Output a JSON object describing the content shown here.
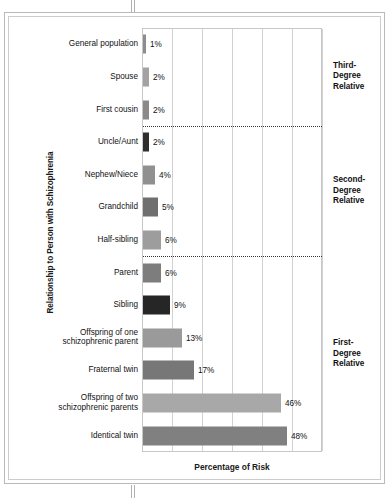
{
  "chart_data": {
    "type": "bar",
    "orientation": "horizontal",
    "title": "",
    "xlabel": "Percentage of Risk",
    "ylabel": "Relationship to Person with Schizophrenia",
    "xlim": [
      0,
      60
    ],
    "grid": true,
    "gridlines_x": [
      0,
      10,
      20,
      30,
      40,
      50,
      60
    ],
    "legend": "none",
    "categories": [
      "General population",
      "Spouse",
      "First cousin",
      "Uncle/Aunt",
      "Nephew/Niece",
      "Grandchild",
      "Half-sibling",
      "Parent",
      "Sibling",
      "Offspring of one schizophrenic parent",
      "Fraternal twin",
      "Offspring of two schizophrenic parents",
      "Identical twin"
    ],
    "values": [
      1,
      2,
      2,
      2,
      4,
      5,
      6,
      6,
      9,
      13,
      17,
      46,
      48
    ],
    "value_labels": [
      "1%",
      "2%",
      "2%",
      "2%",
      "4%",
      "5%",
      "6%",
      "6%",
      "9%",
      "13%",
      "17%",
      "46%",
      "48%"
    ],
    "bar_colors": [
      "#8d8d8d",
      "#a3a3a3",
      "#8a8a8a",
      "#2e2e2e",
      "#909090",
      "#6f6f6f",
      "#9d9d9d",
      "#7d7d7d",
      "#262626",
      "#9a9a9a",
      "#777777",
      "#a8a8a8",
      "#808080"
    ],
    "annotations": [
      {
        "label": "Third-Degree Relative",
        "line1": "Third-",
        "line2": "Degree",
        "line3": "Relative",
        "covers": [
          "Spouse",
          "First cousin",
          "General population"
        ]
      },
      {
        "label": "Second-Degree Relative",
        "line1": "Second-",
        "line2": "Degree",
        "line3": "Relative",
        "covers": [
          "Uncle/Aunt",
          "Nephew/Niece",
          "Grandchild",
          "Half-sibling"
        ]
      },
      {
        "label": "First-Degree Relative",
        "line1": "First-",
        "line2": "Degree",
        "line3": "Relative",
        "covers": [
          "Parent",
          "Sibling",
          "Offspring of one schizophrenic parent",
          "Fraternal twin",
          "Offspring of two schizophrenic parents",
          "Identical twin"
        ]
      }
    ],
    "separators_after": [
      "First cousin",
      "Half-sibling"
    ]
  },
  "rows": [
    {
      "label_line1": "General population",
      "label_line2": "",
      "value": "1%"
    },
    {
      "label_line1": "Spouse",
      "label_line2": "",
      "value": "2%"
    },
    {
      "label_line1": "First cousin",
      "label_line2": "",
      "value": "2%"
    },
    {
      "label_line1": "Uncle/Aunt",
      "label_line2": "",
      "value": "2%"
    },
    {
      "label_line1": "Nephew/Niece",
      "label_line2": "",
      "value": "4%"
    },
    {
      "label_line1": "Grandchild",
      "label_line2": "",
      "value": "5%"
    },
    {
      "label_line1": "Half-sibling",
      "label_line2": "",
      "value": "6%"
    },
    {
      "label_line1": "Parent",
      "label_line2": "",
      "value": "6%"
    },
    {
      "label_line1": "Sibling",
      "label_line2": "",
      "value": "9%"
    },
    {
      "label_line1": "Offspring of one",
      "label_line2": "schizophrenic parent",
      "value": "13%"
    },
    {
      "label_line1": "Fraternal twin",
      "label_line2": "",
      "value": "17%"
    },
    {
      "label_line1": "Offspring of two",
      "label_line2": "schizophrenic parents",
      "value": "46%"
    },
    {
      "label_line1": "Identical twin",
      "label_line2": "",
      "value": "48%"
    }
  ],
  "axis": {
    "x_title": "Percentage of Risk",
    "y_title": "Relationship to Person with Schizophrenia"
  },
  "groups": [
    {
      "l1": "Third-",
      "l2": "Degree",
      "l3": "Relative"
    },
    {
      "l1": "Second-",
      "l2": "Degree",
      "l3": "Relative"
    },
    {
      "l1": "First-",
      "l2": "Degree",
      "l3": "Relative"
    }
  ]
}
